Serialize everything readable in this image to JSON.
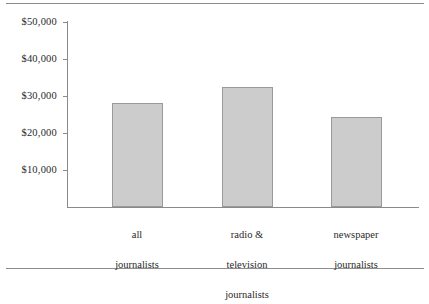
{
  "figure": {
    "has_top_rule": true,
    "has_bottom_rule": true,
    "bar_fill_color": "#cccccc",
    "bar_border_color": "#9a9a9a",
    "axis_color": "#8a8a8a"
  },
  "chart_data": {
    "type": "bar",
    "title": "",
    "subtitle": "",
    "xlabel": "",
    "ylabel": "",
    "categories": [
      "all journalists",
      "radio & television journalists",
      "newspaper journalists"
    ],
    "category_label_lines": [
      [
        "all",
        "journalists"
      ],
      [
        "radio &",
        "television",
        "journalists"
      ],
      [
        "newspaper",
        "journalists"
      ]
    ],
    "values": [
      28000,
      32300,
      24300
    ],
    "value_labels": [
      "$28,000",
      "$32,300",
      "$24,300"
    ],
    "ylim": [
      0,
      50000
    ],
    "ytick_values": [
      10000,
      20000,
      30000,
      40000,
      50000
    ],
    "ytick_labels": [
      "$10,000",
      "$20,000",
      "$30,000",
      "$40,000",
      "$50,000"
    ],
    "grid": false,
    "legend": false,
    "legend_position": "none"
  },
  "axis": {
    "y_ticks": [
      {
        "label": "$50,000",
        "value": 50000
      },
      {
        "label": "$40,000",
        "value": 40000
      },
      {
        "label": "$30,000",
        "value": 30000
      },
      {
        "label": "$20,000",
        "value": 20000
      },
      {
        "label": "$10,000",
        "value": 10000
      }
    ]
  },
  "bars": [
    {
      "label_line_1": "all",
      "label_line_2": "journalists",
      "label_line_3": "",
      "value": 28000
    },
    {
      "label_line_1": "radio &",
      "label_line_2": "television",
      "label_line_3": "journalists",
      "value": 32300
    },
    {
      "label_line_1": "newspaper",
      "label_line_2": "journalists",
      "label_line_3": "",
      "value": 24300
    }
  ]
}
